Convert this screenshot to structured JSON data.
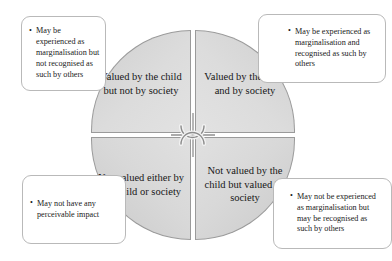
{
  "diagram": {
    "shape": "circle-four-quadrants",
    "colors": {
      "quadrant_fill": "#d8d8d8",
      "quadrant_stroke": "#9a9a9a",
      "callout_stroke": "#b9b9b9",
      "background": "#ffffff",
      "text": "#1a1a1a"
    },
    "centre_connector": "jump-crossover-arcs",
    "quadrants": [
      {
        "position": "top-left",
        "label": "Valued by the child but not by society"
      },
      {
        "position": "top-right",
        "label": "Valued by the child and by society"
      },
      {
        "position": "bottom-left",
        "label": "Not valued either by the child or society"
      },
      {
        "position": "bottom-right",
        "label": "Not valued by the child but valued by society"
      }
    ],
    "callouts": [
      {
        "position": "top-left",
        "linked_quadrant": "top-left",
        "text": "May be experienced as marginalisation but not recognised as such by others"
      },
      {
        "position": "top-right",
        "linked_quadrant": "top-right",
        "text": "May be experienced as marginalisation and recognised as such by others"
      },
      {
        "position": "bottom-left",
        "linked_quadrant": "bottom-left",
        "text": "May not have any perceivable impact"
      },
      {
        "position": "bottom-right",
        "linked_quadrant": "bottom-right",
        "text": "May not be experienced as marginalisation but may be recognised as such by others"
      }
    ]
  }
}
